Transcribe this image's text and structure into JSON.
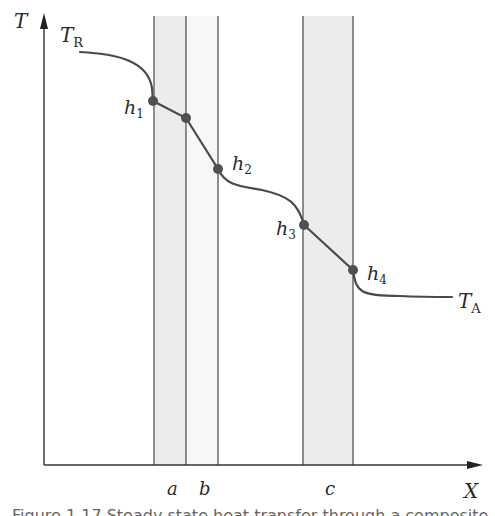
{
  "diagram": {
    "axes": {
      "y_label": "T",
      "x_label": "X"
    },
    "curve_labels": {
      "start": {
        "main": "T",
        "sub": "R"
      },
      "end": {
        "main": "T",
        "sub": "A"
      }
    },
    "points": [
      {
        "main": "h",
        "sub": "1"
      },
      {
        "main": "h",
        "sub": "2"
      },
      {
        "main": "h",
        "sub": "3"
      },
      {
        "main": "h",
        "sub": "4"
      }
    ],
    "regions": [
      {
        "label": "a",
        "shaded": true
      },
      {
        "label": "b",
        "shaded": false
      },
      {
        "label": "c",
        "shaded": true
      }
    ],
    "colors": {
      "line": "#4a4a4a",
      "shade": "#ececec",
      "point": "#505050"
    }
  },
  "caption": "Figure 1.17 Steady state heat transfer through a composite wall"
}
